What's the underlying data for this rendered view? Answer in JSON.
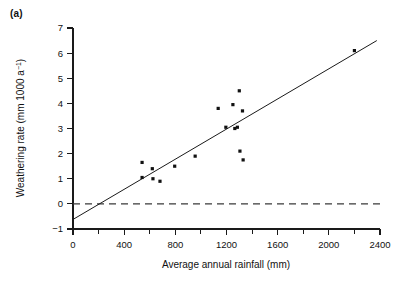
{
  "panel": {
    "label": "(a)"
  },
  "chart_data": {
    "type": "scatter",
    "title": "",
    "xlabel": "Average annual rainfall (mm)",
    "ylabel_text": "Weathering rate (mm 1000 a",
    "ylabel_sup": "−1",
    "ylabel_tail": ")",
    "ylabel_full": "Weathering rate (mm 1000 a⁻¹)",
    "xlim": [
      0,
      2400
    ],
    "ylim": [
      -1,
      7
    ],
    "grid": false,
    "legend": "none",
    "xticks": [
      0,
      400,
      800,
      1200,
      1600,
      2000,
      2400
    ],
    "xtick_labels": [
      "0",
      "400",
      "800",
      "1200",
      "1600",
      "2000",
      "2400"
    ],
    "xticks_minor": [
      200,
      600,
      1000,
      1400,
      1800,
      2200
    ],
    "yticks": [
      -1,
      0,
      1,
      2,
      3,
      4,
      5,
      6,
      7
    ],
    "ytick_labels": [
      "−1",
      "0",
      "1",
      "2",
      "3",
      "4",
      "5",
      "6",
      "7"
    ],
    "points": [
      {
        "x": 540,
        "y": 1.05
      },
      {
        "x": 540,
        "y": 1.65
      },
      {
        "x": 620,
        "y": 1.4
      },
      {
        "x": 625,
        "y": 1.0
      },
      {
        "x": 680,
        "y": 0.9
      },
      {
        "x": 795,
        "y": 1.5
      },
      {
        "x": 955,
        "y": 1.9
      },
      {
        "x": 1135,
        "y": 3.8
      },
      {
        "x": 1195,
        "y": 3.05
      },
      {
        "x": 1250,
        "y": 3.95
      },
      {
        "x": 1265,
        "y": 3.0
      },
      {
        "x": 1285,
        "y": 3.05
      },
      {
        "x": 1300,
        "y": 4.5
      },
      {
        "x": 1305,
        "y": 2.1
      },
      {
        "x": 1325,
        "y": 3.7
      },
      {
        "x": 1330,
        "y": 1.75
      },
      {
        "x": 2200,
        "y": 6.1
      }
    ],
    "regression_line": {
      "name": "least-squares fit",
      "x_start": 0,
      "y_start": -0.62,
      "x_end": 2375,
      "y_end": 6.5
    },
    "zero_line": {
      "name": "zero weathering reference",
      "y": 0,
      "x_start": 0,
      "x_end": 2400,
      "style": "dashed"
    }
  },
  "colors": {
    "ink": "#111111",
    "axis": "#1a1a1a",
    "zero_line": "#3a3a3a",
    "background": "#ffffff"
  }
}
